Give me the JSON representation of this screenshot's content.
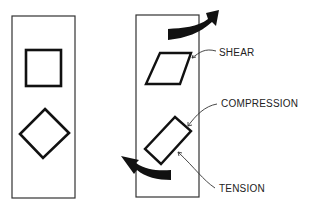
{
  "diagram": {
    "left_panel": {
      "description": "unstressed element",
      "shapes": [
        "square",
        "diamond"
      ]
    },
    "right_panel": {
      "description": "element under shear couple",
      "labels": {
        "shear": "SHEAR",
        "compression": "COMPRESSION",
        "tension": "TENSION"
      }
    },
    "colors": {
      "stroke": "#111111",
      "background": "#ffffff"
    }
  }
}
